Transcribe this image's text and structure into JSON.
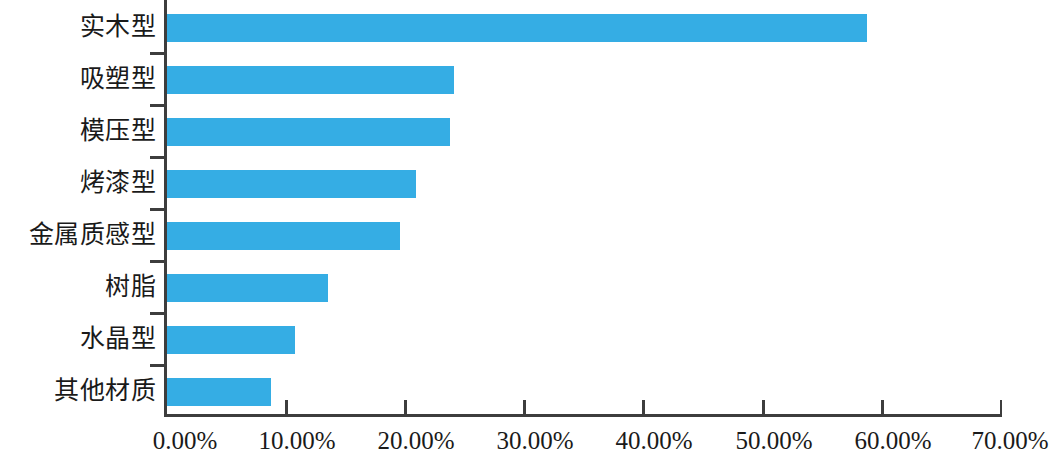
{
  "chart_data": {
    "type": "bar",
    "orientation": "horizontal",
    "title": "",
    "subtitle": "",
    "xlabel": "",
    "ylabel": "",
    "grid": false,
    "legend": null,
    "legend_position": "none",
    "bar_color": "#35ade4",
    "axis_color": "#3d3d3d",
    "background_color": "#ffffff",
    "xlim": [
      0,
      70
    ],
    "x_tick_labels": [
      "0.00%",
      "10.00%",
      "20.00%",
      "30.00%",
      "40.00%",
      "50.00%",
      "60.00%",
      "70.00%"
    ],
    "x_ticks": [
      0,
      10,
      20,
      30,
      40,
      50,
      60,
      70
    ],
    "categories": [
      "实木型",
      "吸塑型",
      "模压型",
      "烤漆型",
      "金属质感型",
      "树脂",
      "水晶型",
      "其他材质"
    ],
    "values": [
      58.8,
      24.2,
      23.8,
      21.0,
      19.6,
      13.6,
      10.8,
      8.8
    ],
    "value_labels": [
      "58.80%",
      "24.20%",
      "23.80%",
      "21.00%",
      "19.60%",
      "13.60%",
      "10.80%",
      "8.80%"
    ]
  }
}
